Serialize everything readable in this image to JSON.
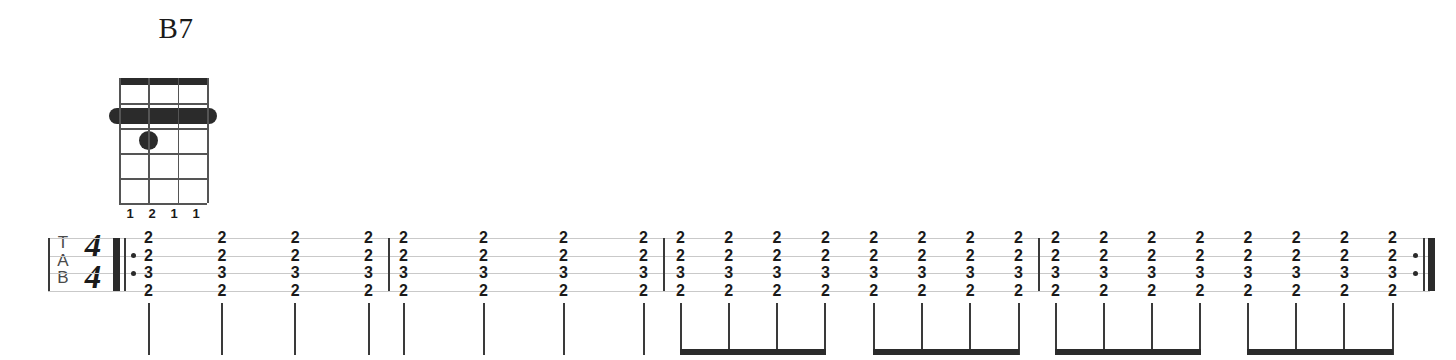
{
  "chord": {
    "name": "B7",
    "strings": 4,
    "frets": 5,
    "barre": {
      "fret": 2,
      "from_string": 1,
      "to_string": 4
    },
    "dots": [
      {
        "string": 2,
        "fret": 3
      }
    ],
    "fingering": [
      "1",
      "2",
      "1",
      "1"
    ],
    "nut": true
  },
  "tab": {
    "clef": "TAB",
    "clef_letters": [
      "T",
      "A",
      "B"
    ],
    "time_signature": {
      "numerator": "4",
      "denominator": "4"
    },
    "string_count": 4,
    "repeat_start": true,
    "repeat_end": true,
    "measures": [
      {
        "index": 1,
        "note_value": "quarter",
        "beamed": false,
        "chords": [
          [
            "2",
            "2",
            "3",
            "2"
          ],
          [
            "2",
            "2",
            "3",
            "2"
          ],
          [
            "2",
            "2",
            "3",
            "2"
          ],
          [
            "2",
            "2",
            "3",
            "2"
          ]
        ]
      },
      {
        "index": 2,
        "note_value": "quarter",
        "beamed": false,
        "chords": [
          [
            "2",
            "2",
            "3",
            "2"
          ],
          [
            "2",
            "2",
            "3",
            "2"
          ],
          [
            "2",
            "2",
            "3",
            "2"
          ],
          [
            "2",
            "2",
            "3",
            "2"
          ]
        ]
      },
      {
        "index": 3,
        "note_value": "eighth",
        "beamed": true,
        "beam_groups": [
          4,
          4
        ],
        "chords": [
          [
            "2",
            "2",
            "3",
            "2"
          ],
          [
            "2",
            "2",
            "3",
            "2"
          ],
          [
            "2",
            "2",
            "3",
            "2"
          ],
          [
            "2",
            "2",
            "3",
            "2"
          ],
          [
            "2",
            "2",
            "3",
            "2"
          ],
          [
            "2",
            "2",
            "3",
            "2"
          ],
          [
            "2",
            "2",
            "3",
            "2"
          ],
          [
            "2",
            "2",
            "3",
            "2"
          ]
        ]
      },
      {
        "index": 4,
        "note_value": "eighth",
        "beamed": true,
        "beam_groups": [
          4,
          4
        ],
        "chords": [
          [
            "2",
            "2",
            "3",
            "2"
          ],
          [
            "2",
            "2",
            "3",
            "2"
          ],
          [
            "2",
            "2",
            "3",
            "2"
          ],
          [
            "2",
            "2",
            "3",
            "2"
          ],
          [
            "2",
            "2",
            "3",
            "2"
          ],
          [
            "2",
            "2",
            "3",
            "2"
          ],
          [
            "2",
            "2",
            "3",
            "2"
          ],
          [
            "2",
            "2",
            "3",
            "2"
          ]
        ]
      }
    ]
  },
  "colors": {
    "ink": "#1a1a1a",
    "staff_line": "#c9c9c9",
    "barline": "#3a3a3a",
    "beam": "#2b2b2b"
  }
}
